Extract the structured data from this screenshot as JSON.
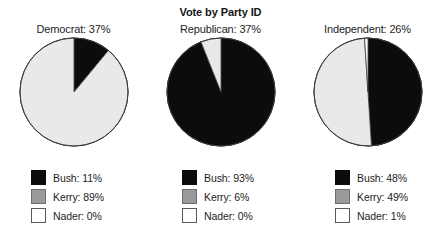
{
  "chart_data": {
    "type": "pie",
    "title": "Vote by Party ID",
    "xlabel": "",
    "ylabel": "",
    "legend_position": "below-each-pie",
    "grid": false,
    "slice_colors": {
      "Bush": "#0c0c0c",
      "Kerry": "#e9e9e9",
      "Nader": "#ffffff"
    },
    "swatch_colors": {
      "Bush": "#0c0c0c",
      "Kerry": "#9a9a9a",
      "Nader": "#ffffff"
    },
    "categories": [
      "Bush",
      "Kerry",
      "Nader"
    ],
    "panels": [
      {
        "label": "Democrat: 37%",
        "group": "Democrat",
        "group_share": 37,
        "values": [
          11,
          89,
          0
        ],
        "legend": [
          {
            "name": "Bush",
            "text": "Bush: 11%",
            "value": 11,
            "color": "#0c0c0c"
          },
          {
            "name": "Kerry",
            "text": "Kerry: 89%",
            "value": 89,
            "color": "#9a9a9a"
          },
          {
            "name": "Nader",
            "text": "Nader: 0%",
            "value": 0,
            "color": "#ffffff"
          }
        ]
      },
      {
        "label": "Republican: 37%",
        "group": "Republican",
        "group_share": 37,
        "values": [
          93,
          6,
          0
        ],
        "legend": [
          {
            "name": "Bush",
            "text": "Bush: 93%",
            "value": 93,
            "color": "#0c0c0c"
          },
          {
            "name": "Kerry",
            "text": "Kerry: 6%",
            "value": 6,
            "color": "#9a9a9a"
          },
          {
            "name": "Nader",
            "text": "Nader: 0%",
            "value": 0,
            "color": "#ffffff"
          }
        ]
      },
      {
        "label": "Independent: 26%",
        "group": "Independent",
        "group_share": 26,
        "values": [
          48,
          49,
          1
        ],
        "legend": [
          {
            "name": "Bush",
            "text": "Bush: 48%",
            "value": 48,
            "color": "#0c0c0c"
          },
          {
            "name": "Kerry",
            "text": "Kerry: 49%",
            "value": 49,
            "color": "#9a9a9a"
          },
          {
            "name": "Nader",
            "text": "Nader: 1%",
            "value": 1,
            "color": "#ffffff"
          }
        ]
      }
    ]
  }
}
